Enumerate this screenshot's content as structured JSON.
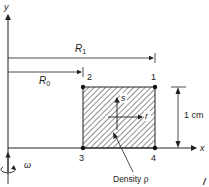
{
  "axes": {
    "x_label": "x",
    "y_label": "y"
  },
  "dimensions": {
    "r1_label": "R",
    "r1_sub": "1",
    "r0_label": "R",
    "r0_sub": "0",
    "height_label": "1 cm"
  },
  "nodes": [
    {
      "id": "1",
      "label": "1"
    },
    {
      "id": "2",
      "label": "2"
    },
    {
      "id": "3",
      "label": "3"
    },
    {
      "id": "4",
      "label": "4"
    }
  ],
  "local_axes": {
    "s_label": "s",
    "r_label": "r"
  },
  "annotation": {
    "density_label": "Density ρ"
  },
  "rotation": {
    "omega_label": "ω"
  },
  "colors": {
    "ink": "#222222",
    "hatch": "#333333"
  }
}
